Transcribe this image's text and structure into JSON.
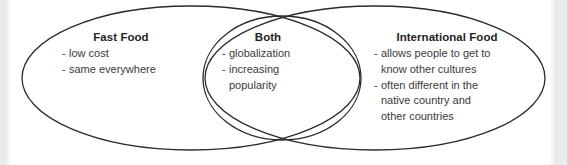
{
  "diagram": {
    "type": "venn-diagram",
    "background_color": "#ffffff",
    "stroke_color": "#2b2b2b",
    "edge_strip_color": "#e9eaec",
    "groups": [
      {
        "id": "fast-food",
        "title": "Fast Food",
        "items": [
          {
            "dash": "-",
            "lines": [
              "low cost"
            ]
          },
          {
            "dash": "-",
            "lines": [
              "same everywhere"
            ]
          }
        ]
      },
      {
        "id": "both",
        "title": "Both",
        "items": [
          {
            "dash": "-",
            "lines": [
              "globalization"
            ]
          },
          {
            "dash": "-",
            "lines": [
              "increasing",
              "popularity"
            ]
          }
        ]
      },
      {
        "id": "international-food",
        "title": "International Food",
        "items": [
          {
            "dash": "-",
            "lines": [
              "allows people to get to",
              "know other cultures"
            ]
          },
          {
            "dash": "-",
            "lines": [
              "often different in the",
              "native country and",
              "other countries"
            ]
          }
        ]
      }
    ]
  }
}
